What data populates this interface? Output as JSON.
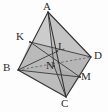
{
  "figure": {
    "kind": "geometry-diagram",
    "background_color": "#fdfdfd",
    "stroke_color": "#3a3a3a",
    "dashed_stroke_color": "#5a5a5a",
    "fill_light": "#d9d9d9",
    "fill_mid": "#cfcfcf",
    "fill_dark": "#bdbdbd",
    "fill_darkest": "#ababab",
    "label_color": "#2b2b2b"
  },
  "vertices": {
    "A": {
      "label": "A",
      "x": 48,
      "y": 12,
      "label_x": 44,
      "label_y": 0
    },
    "B": {
      "label": "B",
      "x": 18,
      "y": 70,
      "label_x": 4,
      "label_y": 63
    },
    "C": {
      "label": "C",
      "x": 66,
      "y": 97,
      "label_x": 62,
      "label_y": 99
    },
    "D": {
      "label": "D",
      "x": 91,
      "y": 57,
      "label_x": 94,
      "label_y": 51
    },
    "K": {
      "label": "K",
      "x": 30,
      "y": 42,
      "label_x": 16,
      "label_y": 32
    },
    "L": {
      "label": "L",
      "x": 56,
      "y": 50,
      "label_x": 57,
      "label_y": 42
    },
    "M": {
      "label": "M",
      "x": 80,
      "y": 77,
      "label_x": 81,
      "label_y": 72
    },
    "N": {
      "label": "N",
      "x": 54,
      "y": 66,
      "label_x": 47,
      "label_y": 60
    }
  },
  "edges": [
    {
      "name": "AB",
      "from": "A",
      "to": "B",
      "style": "solid"
    },
    {
      "name": "AC",
      "from": "A",
      "to": "C",
      "style": "solid"
    },
    {
      "name": "AD",
      "from": "A",
      "to": "D",
      "style": "solid"
    },
    {
      "name": "BC",
      "from": "B",
      "to": "C",
      "style": "solid"
    },
    {
      "name": "CD",
      "from": "C",
      "to": "D",
      "style": "solid"
    },
    {
      "name": "BD",
      "from": "B",
      "to": "D",
      "style": "dashed"
    }
  ],
  "section_segments": [
    {
      "name": "KD",
      "from": "K",
      "to": "D",
      "style": "solid"
    },
    {
      "name": "KM",
      "from": "K",
      "to": "M",
      "style": "solid"
    },
    {
      "name": "BM",
      "from": "B",
      "to": "M",
      "style": "solid"
    },
    {
      "name": "BL",
      "from": "B",
      "to": "L",
      "style": "solid"
    },
    {
      "name": "AN",
      "from": "A",
      "to": "N",
      "style": "solid"
    },
    {
      "name": "NC",
      "from": "N",
      "to": "C",
      "style": "solid"
    }
  ],
  "labels": [
    "A",
    "K",
    "L",
    "D",
    "B",
    "N",
    "M",
    "C"
  ]
}
